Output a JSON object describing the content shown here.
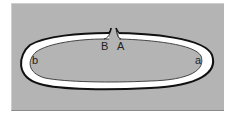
{
  "diagram": {
    "type": "ring-loop",
    "labels": {
      "gap_left": "B",
      "gap_right": "A",
      "inner_left": "b",
      "inner_right": "a"
    },
    "colors": {
      "background": "#b4b4b4",
      "ring_fill": "#ffffff",
      "outer_edge": "#111111",
      "inner_edge": "#444444"
    }
  }
}
